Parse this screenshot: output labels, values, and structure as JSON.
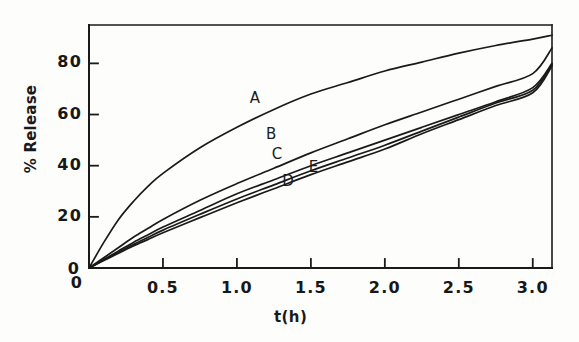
{
  "chart_data": {
    "type": "line",
    "title": "",
    "xlabel": "t(h)",
    "ylabel": "% Release",
    "xlim": [
      0,
      3.13
    ],
    "ylim": [
      0,
      95
    ],
    "grid": false,
    "legend": "inline-curve-labels",
    "x_ticks": [
      {
        "value": 0,
        "label": "0"
      },
      {
        "value": 0.5,
        "label": "0.5"
      },
      {
        "value": 1.0,
        "label": "1.0"
      },
      {
        "value": 1.5,
        "label": "1.5"
      },
      {
        "value": 2.0,
        "label": "2.0"
      },
      {
        "value": 2.5,
        "label": "2.5"
      },
      {
        "value": 3.0,
        "label": "3.0"
      }
    ],
    "y_ticks": [
      {
        "value": 0,
        "label": "0"
      },
      {
        "value": 20,
        "label": "20"
      },
      {
        "value": 40,
        "label": "40"
      },
      {
        "value": 60,
        "label": "60"
      },
      {
        "value": 80,
        "label": "80"
      }
    ],
    "x": [
      0,
      0.1,
      0.2,
      0.3,
      0.4,
      0.5,
      0.75,
      1.0,
      1.25,
      1.5,
      1.75,
      2.0,
      2.25,
      2.5,
      2.75,
      3.0,
      3.13
    ],
    "series": [
      {
        "name": "A",
        "label": "A",
        "values": [
          0,
          10,
          19,
          26,
          32,
          37,
          47,
          55,
          62,
          68,
          72.5,
          77,
          80.5,
          84,
          87,
          89.5,
          91
        ],
        "label_position": {
          "t": 1.12,
          "release": 66
        }
      },
      {
        "name": "B",
        "label": "B",
        "values": [
          0,
          4,
          8,
          12,
          15.5,
          19,
          26.5,
          33,
          39,
          45,
          50.5,
          56,
          61,
          66,
          71,
          76,
          86
        ],
        "label_position": {
          "t": 1.23,
          "release": 52
        }
      },
      {
        "name": "C",
        "label": "C",
        "values": [
          0,
          3.3,
          6.7,
          10,
          13,
          16,
          22.5,
          29,
          34.5,
          40,
          45,
          50,
          55,
          60,
          65,
          70.5,
          80
        ],
        "label_position": {
          "t": 1.27,
          "release": 44
        }
      },
      {
        "name": "D",
        "label": "D",
        "values": [
          0,
          3.1,
          6.2,
          9.2,
          12,
          14.8,
          21,
          27,
          32.5,
          38,
          43,
          48,
          53.5,
          59,
          64.5,
          69.5,
          79.5
        ],
        "label_position": {
          "t": 1.34,
          "release": 33.5
        }
      },
      {
        "name": "E",
        "label": "E",
        "values": [
          0,
          2.9,
          5.8,
          8.6,
          11.2,
          13.8,
          19.7,
          25.5,
          31,
          36.5,
          41.5,
          46.5,
          52.5,
          58,
          63.5,
          68.5,
          79
        ],
        "label_position": {
          "t": 1.52,
          "release": 39
        }
      }
    ],
    "colors": {
      "line": "#1a1a1a",
      "axis": "#1a1a1a",
      "background": "#fdfdfc"
    }
  },
  "figure": {
    "origin_label_y": "0",
    "origin_label_x": "0"
  }
}
